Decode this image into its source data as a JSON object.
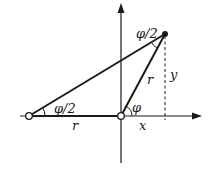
{
  "diagram": {
    "title": "",
    "labels": {
      "half_angle_left": "φ/2",
      "half_angle_top": "φ/2",
      "angle_origin": "φ",
      "side_r_bottom": "r",
      "side_r_slant": "r",
      "coord_x": "x",
      "coord_y": "y"
    },
    "points": {
      "left": {
        "name": "left-point",
        "style": "open-circle"
      },
      "origin": {
        "name": "origin-point",
        "style": "open-circle"
      },
      "top": {
        "name": "top-point",
        "style": "filled-circle"
      }
    },
    "axes": {
      "x": {
        "arrow": true
      },
      "y": {
        "arrow": true
      }
    },
    "colors": {
      "stroke": "#1a1a1a",
      "background": "#ffffff"
    }
  }
}
